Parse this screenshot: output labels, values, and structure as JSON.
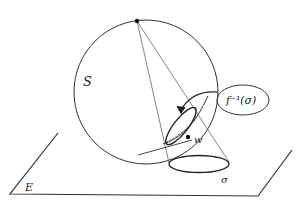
{
  "diagram": {
    "type": "stereographic-projection",
    "labels": {
      "sphere": "S",
      "plane": "E",
      "point": "w",
      "region": "σ",
      "preimage": "f⁻¹(σ)"
    },
    "colors": {
      "stroke": "#222222",
      "background": "#ffffff"
    }
  }
}
